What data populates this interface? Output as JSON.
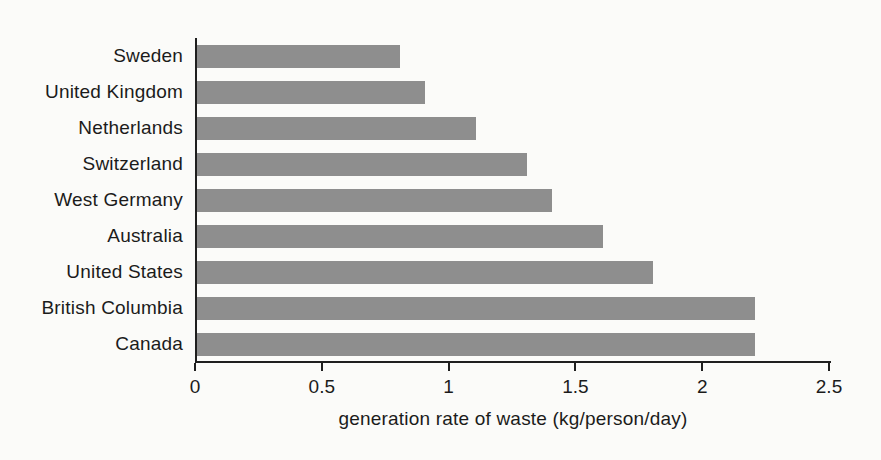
{
  "chart_data": {
    "type": "bar",
    "orientation": "horizontal",
    "title": "",
    "categories": [
      "Sweden",
      "United Kingdom",
      "Netherlands",
      "Switzerland",
      "West Germany",
      "Australia",
      "United States",
      "British Columbia",
      "Canada"
    ],
    "values": [
      0.8,
      0.9,
      1.1,
      1.3,
      1.4,
      1.6,
      1.8,
      2.2,
      2.2
    ],
    "xlabel": "generation rate of waste (kg/person/day)",
    "ylabel": "",
    "xlim": [
      0,
      2.5
    ],
    "xticks": [
      0,
      0.5,
      1,
      1.5,
      2,
      2.5
    ],
    "xtick_labels": [
      "0",
      "0.5",
      "1",
      "1.5",
      "2",
      "2.5"
    ],
    "grid": false,
    "legend": false,
    "bar_color": "#8e8e8e",
    "axis_color": "#1f1f1f",
    "text_color": "#1b1b1b",
    "background_color": "#fbfbf9"
  }
}
